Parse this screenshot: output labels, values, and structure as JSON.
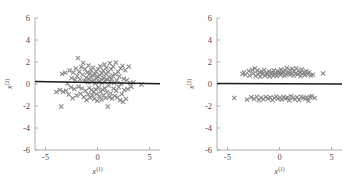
{
  "figure": {
    "background": "#ffffff",
    "marker_color": "#848484",
    "line_color": "#1a1a1a",
    "axis_color": "#9a9a9a",
    "text_color": "#4a4a4a"
  },
  "chart_data": [
    {
      "type": "scatter",
      "panel": "left",
      "title": "",
      "xlabel": "x",
      "xlabel_sup": "(1)",
      "ylabel": "x",
      "ylabel_sup": "(2)",
      "xlim": [
        -6,
        6
      ],
      "ylim": [
        -6,
        6
      ],
      "xticks": [
        -5,
        0,
        5
      ],
      "yticks": [
        -6,
        -4,
        -2,
        0,
        2,
        4,
        6
      ],
      "xtick_labels": [
        "-5",
        "0",
        "5"
      ],
      "ytick_labels": [
        "-6",
        "-4",
        "-2",
        "0",
        "2",
        "4",
        "6"
      ],
      "grid": false,
      "legend": null,
      "marker": "x",
      "fit_line": {
        "slope": -0.018,
        "intercept": 0.12,
        "x_start": -6.0,
        "x_end": 6.0
      },
      "points": [
        [
          -3.95,
          -0.72
        ],
        [
          -3.62,
          -0.55
        ],
        [
          -3.48,
          -2.05
        ],
        [
          -3.4,
          0.92
        ],
        [
          -3.28,
          -0.7
        ],
        [
          -3.1,
          1.02
        ],
        [
          -3.02,
          -0.6
        ],
        [
          -2.88,
          0.05
        ],
        [
          -2.76,
          -0.95
        ],
        [
          -2.68,
          1.22
        ],
        [
          -2.55,
          -0.3
        ],
        [
          -2.48,
          0.55
        ],
        [
          -2.4,
          -1.3
        ],
        [
          -2.32,
          1.05
        ],
        [
          -2.22,
          -0.45
        ],
        [
          -2.15,
          0.38
        ],
        [
          -2.08,
          1.42
        ],
        [
          -2.0,
          -1.05
        ],
        [
          -1.95,
          0.72
        ],
        [
          -1.88,
          2.35
        ],
        [
          -1.82,
          -0.25
        ],
        [
          -1.75,
          1.12
        ],
        [
          -1.68,
          0.42
        ],
        [
          -1.62,
          -0.88
        ],
        [
          -1.55,
          1.55
        ],
        [
          -1.5,
          -0.4
        ],
        [
          -1.44,
          0.85
        ],
        [
          -1.38,
          1.92
        ],
        [
          -1.32,
          -1.18
        ],
        [
          -1.26,
          0.28
        ],
        [
          -1.2,
          1.35
        ],
        [
          -1.15,
          -0.62
        ],
        [
          -1.1,
          0.58
        ],
        [
          -1.05,
          -1.45
        ],
        [
          -1.0,
          1.05
        ],
        [
          -0.95,
          0.15
        ],
        [
          -0.9,
          -0.95
        ],
        [
          -0.86,
          1.68
        ],
        [
          -0.82,
          0.45
        ],
        [
          -0.78,
          -0.35
        ],
        [
          -0.74,
          0.95
        ],
        [
          -0.7,
          -1.22
        ],
        [
          -0.66,
          0.62
        ],
        [
          -0.62,
          1.28
        ],
        [
          -0.58,
          -0.55
        ],
        [
          -0.54,
          0.22
        ],
        [
          -0.5,
          -1.05
        ],
        [
          -0.46,
          0.78
        ],
        [
          -0.42,
          1.48
        ],
        [
          -0.38,
          -0.72
        ],
        [
          -0.34,
          0.35
        ],
        [
          -0.3,
          -1.35
        ],
        [
          -0.26,
          0.88
        ],
        [
          -0.22,
          0.05
        ],
        [
          -0.18,
          -0.48
        ],
        [
          -0.14,
          1.15
        ],
        [
          -0.1,
          -0.92
        ],
        [
          -0.06,
          0.52
        ],
        [
          -0.02,
          -1.52
        ],
        [
          0.02,
          0.68
        ],
        [
          0.06,
          1.32
        ],
        [
          0.1,
          -0.32
        ],
        [
          0.14,
          0.18
        ],
        [
          0.18,
          -1.12
        ],
        [
          0.22,
          0.82
        ],
        [
          0.26,
          1.62
        ],
        [
          0.3,
          -0.68
        ],
        [
          0.34,
          0.42
        ],
        [
          0.38,
          -1.42
        ],
        [
          0.42,
          0.98
        ],
        [
          0.46,
          0.08
        ],
        [
          0.5,
          -0.52
        ],
        [
          0.54,
          1.22
        ],
        [
          0.58,
          -1.02
        ],
        [
          0.62,
          0.58
        ],
        [
          0.66,
          1.78
        ],
        [
          0.7,
          -0.38
        ],
        [
          0.74,
          0.28
        ],
        [
          0.78,
          -1.28
        ],
        [
          0.82,
          0.92
        ],
        [
          0.86,
          1.45
        ],
        [
          0.9,
          -0.75
        ],
        [
          0.94,
          0.38
        ],
        [
          0.98,
          -2.05
        ],
        [
          1.02,
          1.08
        ],
        [
          1.06,
          -0.15
        ],
        [
          1.1,
          0.65
        ],
        [
          1.14,
          -1.18
        ],
        [
          1.18,
          1.88
        ],
        [
          1.22,
          0.22
        ],
        [
          1.26,
          -0.85
        ],
        [
          1.3,
          1.35
        ],
        [
          1.35,
          0.48
        ],
        [
          1.4,
          -1.32
        ],
        [
          1.45,
          0.78
        ],
        [
          1.5,
          1.58
        ],
        [
          1.55,
          -0.42
        ],
        [
          1.6,
          0.12
        ],
        [
          1.65,
          -1.08
        ],
        [
          1.7,
          0.88
        ],
        [
          1.75,
          1.95
        ],
        [
          1.8,
          -0.62
        ],
        [
          1.86,
          0.32
        ],
        [
          1.92,
          -1.22
        ],
        [
          1.98,
          1.12
        ],
        [
          2.04,
          -0.28
        ],
        [
          2.1,
          0.68
        ],
        [
          2.16,
          -1.48
        ],
        [
          2.22,
          1.42
        ],
        [
          2.28,
          0.02
        ],
        [
          2.34,
          -0.92
        ],
        [
          2.4,
          1.65
        ],
        [
          2.46,
          -1.62
        ],
        [
          2.52,
          0.45
        ],
        [
          2.58,
          -0.55
        ],
        [
          2.66,
          1.25
        ],
        [
          2.74,
          -1.35
        ],
        [
          2.82,
          0.35
        ],
        [
          2.9,
          -0.45
        ],
        [
          3.0,
          1.58
        ],
        [
          3.12,
          0.08
        ],
        [
          3.25,
          -0.25
        ],
        [
          3.45,
          0.15
        ],
        [
          4.22,
          -0.05
        ]
      ]
    },
    {
      "type": "scatter",
      "panel": "right",
      "title": "",
      "xlabel": "x",
      "xlabel_sup": "(1)",
      "ylabel": "x",
      "ylabel_sup": "(2)",
      "xlim": [
        -6,
        6
      ],
      "ylim": [
        -6,
        6
      ],
      "xticks": [
        -5,
        0,
        5
      ],
      "yticks": [
        -6,
        -4,
        -2,
        0,
        2,
        4,
        6
      ],
      "xtick_labels": [
        "-5",
        "0",
        "5"
      ],
      "ytick_labels": [
        "-6",
        "-4",
        "-2",
        "0",
        "2",
        "4",
        "6"
      ],
      "grid": false,
      "legend": null,
      "marker": "x",
      "fit_line": {
        "slope": -0.004,
        "intercept": 0.02,
        "x_start": -6.0,
        "x_end": 6.0
      },
      "points": [
        [
          -4.35,
          -1.28
        ],
        [
          -3.55,
          0.92
        ],
        [
          -3.42,
          1.05
        ],
        [
          -3.28,
          0.85
        ],
        [
          -3.12,
          -1.42
        ],
        [
          -2.95,
          1.18
        ],
        [
          -2.88,
          0.78
        ],
        [
          -2.72,
          -1.2
        ],
        [
          -2.6,
          1.3
        ],
        [
          -2.52,
          0.95
        ],
        [
          -2.44,
          -1.35
        ],
        [
          -2.36,
          1.42
        ],
        [
          -2.28,
          0.72
        ],
        [
          -2.2,
          -1.15
        ],
        [
          -2.12,
          1.22
        ],
        [
          -2.05,
          0.88
        ],
        [
          -1.98,
          -1.48
        ],
        [
          -1.9,
          1.05
        ],
        [
          -1.84,
          0.65
        ],
        [
          -1.78,
          -1.25
        ],
        [
          -1.7,
          1.12
        ],
        [
          -1.62,
          0.92
        ],
        [
          -1.55,
          -1.38
        ],
        [
          -1.48,
          1.28
        ],
        [
          -1.4,
          0.75
        ],
        [
          -1.32,
          -1.18
        ],
        [
          -1.25,
          1.02
        ],
        [
          -1.18,
          0.85
        ],
        [
          -1.1,
          -1.32
        ],
        [
          -1.02,
          1.15
        ],
        [
          -0.95,
          0.68
        ],
        [
          -0.88,
          -1.22
        ],
        [
          -0.8,
          0.95
        ],
        [
          -0.74,
          1.08
        ],
        [
          -0.68,
          -1.45
        ],
        [
          -0.62,
          0.78
        ],
        [
          -0.56,
          1.22
        ],
        [
          -0.5,
          -1.28
        ],
        [
          -0.44,
          0.88
        ],
        [
          -0.38,
          1.02
        ],
        [
          -0.32,
          -1.15
        ],
        [
          -0.26,
          0.72
        ],
        [
          -0.2,
          1.18
        ],
        [
          -0.14,
          -1.35
        ],
        [
          -0.08,
          0.92
        ],
        [
          -0.02,
          1.05
        ],
        [
          0.04,
          -1.25
        ],
        [
          0.1,
          0.82
        ],
        [
          0.16,
          1.32
        ],
        [
          0.22,
          -1.42
        ],
        [
          0.28,
          0.95
        ],
        [
          0.34,
          1.12
        ],
        [
          0.4,
          -1.18
        ],
        [
          0.46,
          0.75
        ],
        [
          0.52,
          1.25
        ],
        [
          0.58,
          -1.32
        ],
        [
          0.64,
          0.88
        ],
        [
          0.7,
          1.45
        ],
        [
          0.76,
          -1.22
        ],
        [
          0.82,
          0.98
        ],
        [
          0.88,
          1.08
        ],
        [
          0.94,
          -1.48
        ],
        [
          1.0,
          0.85
        ],
        [
          1.06,
          1.28
        ],
        [
          1.12,
          -1.12
        ],
        [
          1.18,
          0.92
        ],
        [
          1.24,
          1.38
        ],
        [
          1.3,
          -1.28
        ],
        [
          1.36,
          0.78
        ],
        [
          1.42,
          1.15
        ],
        [
          1.48,
          -1.38
        ],
        [
          1.55,
          0.95
        ],
        [
          1.62,
          1.42
        ],
        [
          1.68,
          -1.2
        ],
        [
          1.75,
          0.88
        ],
        [
          1.82,
          1.22
        ],
        [
          1.88,
          -1.45
        ],
        [
          1.95,
          1.02
        ],
        [
          2.02,
          0.72
        ],
        [
          2.08,
          -1.15
        ],
        [
          2.15,
          1.32
        ],
        [
          2.22,
          0.92
        ],
        [
          2.28,
          -1.28
        ],
        [
          2.35,
          1.05
        ],
        [
          2.42,
          0.82
        ],
        [
          2.48,
          -1.35
        ],
        [
          2.55,
          1.18
        ],
        [
          2.62,
          -1.22
        ],
        [
          2.7,
          0.88
        ],
        [
          2.78,
          -1.52
        ],
        [
          2.85,
          1.08
        ],
        [
          2.92,
          -1.18
        ],
        [
          3.0,
          0.78
        ],
        [
          3.1,
          -1.12
        ],
        [
          3.22,
          0.85
        ],
        [
          3.38,
          -1.28
        ],
        [
          4.18,
          0.95
        ]
      ]
    }
  ]
}
